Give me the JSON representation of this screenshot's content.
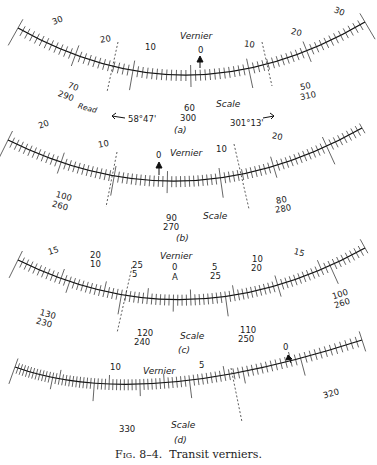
{
  "caption": {
    "fig_label": "Fig. 8–4.",
    "title": "Transit verniers."
  },
  "panels": [
    {
      "id": "a",
      "sub_label": "(a)",
      "vernier_label": "Vernier",
      "scale_label": "Scale",
      "vernier_numbers": [
        "30",
        "20",
        "10",
        "0",
        "10",
        "20",
        "30"
      ],
      "scale_numbers": [
        {
          "top": "70",
          "bottom": "290"
        },
        {
          "top": "60",
          "bottom": "300"
        },
        {
          "top": "50",
          "bottom": "310"
        }
      ],
      "read_label": "Read",
      "reading_left": "58°47'",
      "reading_right": "301°13'"
    },
    {
      "id": "b",
      "sub_label": "(b)",
      "vernier_label": "Vernier",
      "scale_label": "Scale",
      "vernier_numbers": [
        "20",
        "10",
        "0",
        "10",
        "20"
      ],
      "scale_numbers": [
        {
          "top": "100",
          "bottom": "260"
        },
        {
          "top": "90",
          "bottom": "270"
        },
        {
          "top": "80",
          "bottom": "280"
        }
      ]
    },
    {
      "id": "c",
      "sub_label": "(c)",
      "vernier_label": "Vernier",
      "scale_label": "Scale",
      "vernier_numbers": [
        {
          "top": "15",
          "bottom": ""
        },
        {
          "top": "20",
          "bottom": "10"
        },
        {
          "top": "25",
          "bottom": "5"
        },
        {
          "top": "0",
          "bottom": "A"
        },
        {
          "top": "5",
          "bottom": "25"
        },
        {
          "top": "10",
          "bottom": "20"
        },
        {
          "top": "15",
          "bottom": ""
        }
      ],
      "scale_numbers": [
        {
          "top": "130",
          "bottom": "230"
        },
        {
          "top": "120",
          "bottom": "240"
        },
        {
          "top": "110",
          "bottom": "250"
        },
        {
          "top": "100",
          "bottom": "260"
        }
      ]
    },
    {
      "id": "d",
      "sub_label": "(d)",
      "vernier_label": "Vernier",
      "scale_label": "Scale",
      "vernier_numbers": [
        "10",
        "5",
        "0"
      ],
      "scale_numbers": [
        "330",
        "320"
      ]
    }
  ]
}
